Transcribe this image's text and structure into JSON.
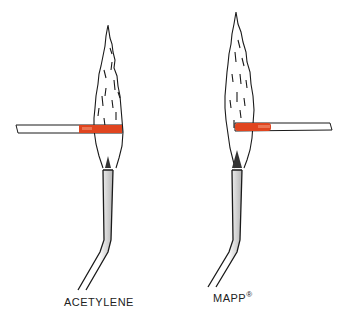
{
  "figure": {
    "torches": [
      {
        "id": "acetylene",
        "label": "ACETYLENE",
        "registered": ""
      },
      {
        "id": "mapp",
        "label": "MAPP",
        "registered": "®"
      }
    ],
    "colors": {
      "line": "#1a1a1a",
      "heated_rod": "#e0451f",
      "rod_fill": "#ffffff",
      "nozzle_shade": "#bdbdbd"
    }
  }
}
